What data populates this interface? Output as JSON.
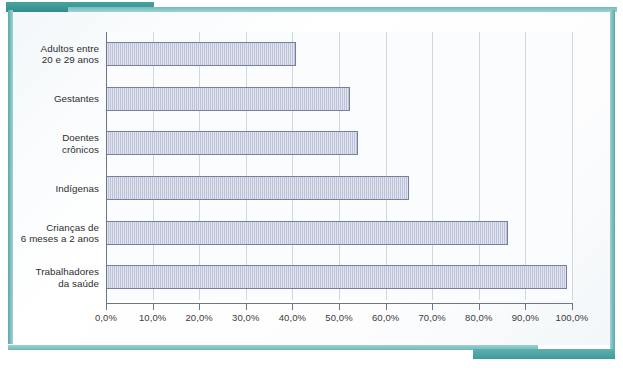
{
  "figure": {
    "frame_accent_color": "#3e9c9c",
    "card_background": "#fbfcfd"
  },
  "chart_data": {
    "type": "bar",
    "orientation": "horizontal",
    "title": "",
    "subtitle": "",
    "xlabel": "",
    "ylabel": "",
    "categories": [
      "Adultos entre\n20 e 29 anos",
      "Gestantes",
      "Doentes\ncrônicos",
      "Indígenas",
      "Crianças de\n6 meses a 2 anos",
      "Trabalhadores\nda saúde"
    ],
    "values": [
      40.8,
      52.4,
      54.0,
      65.0,
      86.2,
      99.0
    ],
    "value_labels": [
      "",
      "",
      "",
      "",
      "",
      ""
    ],
    "xlim": [
      0,
      100
    ],
    "xticks": [
      0,
      10,
      20,
      30,
      40,
      50,
      60,
      70,
      80,
      90,
      100
    ],
    "xticklabels": [
      "0,0%",
      "10,0%",
      "20,0%",
      "30,0%",
      "40,0%",
      "50,0%",
      "60,0%",
      "70,0%",
      "80,0%",
      "90,0%",
      "100,0%"
    ],
    "grid": true,
    "grid_axis": "x",
    "legend": false,
    "legend_position": "none",
    "series": [
      {
        "name": "Cobertura",
        "values": [
          40.8,
          52.4,
          54.0,
          65.0,
          86.2,
          99.0
        ],
        "bar_fill_color": "#bdc3d9",
        "bar_border_color": "#787e9e",
        "hatch": "vertical-lines"
      }
    ]
  }
}
